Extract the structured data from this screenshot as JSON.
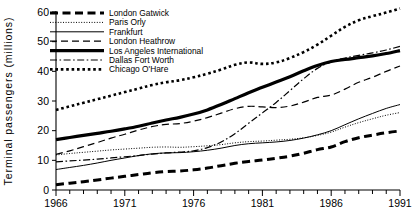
{
  "chart_data": {
    "type": "line",
    "title": "",
    "xlabel": "",
    "ylabel": "Terminal passengers (millions)",
    "xlim": [
      1966,
      1991
    ],
    "ylim": [
      0,
      60
    ],
    "grid": false,
    "legend_position": "top-left",
    "x_ticks_major": [
      "1966",
      "1971",
      "1976",
      "1981",
      "1986",
      "1991"
    ],
    "x_ticks_major_values": [
      1966,
      1971,
      1976,
      1981,
      1986,
      1991
    ],
    "x_minor_tick_step": 1,
    "y_ticks": [
      "0",
      "10",
      "20",
      "30",
      "40",
      "50",
      "60"
    ],
    "y_tick_values": [
      0,
      10,
      20,
      30,
      40,
      50,
      60
    ],
    "x": [
      1966,
      1967,
      1968,
      1969,
      1970,
      1971,
      1972,
      1973,
      1974,
      1975,
      1976,
      1977,
      1978,
      1979,
      1980,
      1981,
      1982,
      1983,
      1984,
      1985,
      1986,
      1987,
      1988,
      1989,
      1990,
      1991
    ],
    "series": [
      {
        "name": "London Gatwick",
        "style": "bold-dashed",
        "values": [
          1.8,
          2.3,
          2.8,
          3.4,
          4.0,
          4.6,
          5.2,
          5.8,
          6.2,
          6.4,
          6.8,
          7.4,
          8.2,
          9.0,
          9.6,
          10.1,
          10.7,
          11.4,
          12.4,
          13.6,
          14.5,
          16.3,
          17.6,
          18.5,
          19.3,
          19.9
        ]
      },
      {
        "name": "Paris Orly",
        "style": "fine-dotted",
        "values": [
          11.8,
          12.3,
          12.7,
          13.1,
          13.5,
          13.8,
          14.1,
          14.4,
          14.5,
          14.4,
          14.6,
          14.9,
          15.3,
          15.9,
          16.3,
          16.5,
          16.8,
          17.1,
          17.6,
          18.4,
          19.5,
          21.2,
          22.7,
          24.0,
          25.2,
          26.1
        ]
      },
      {
        "name": "Frankfurt",
        "style": "thin-solid",
        "values": [
          6.9,
          7.6,
          8.3,
          9.1,
          10.0,
          10.8,
          11.6,
          12.2,
          12.5,
          12.6,
          12.9,
          13.4,
          14.1,
          15.0,
          15.6,
          15.9,
          16.2,
          16.7,
          17.5,
          18.6,
          20.0,
          22.0,
          24.0,
          25.8,
          27.5,
          28.8
        ]
      },
      {
        "name": "London Heathrow",
        "style": "medium-dashed",
        "values": [
          12.0,
          13.2,
          14.6,
          16.0,
          17.5,
          18.8,
          20.2,
          21.4,
          22.1,
          22.4,
          23.2,
          24.4,
          25.9,
          27.4,
          28.2,
          28.0,
          27.8,
          28.3,
          29.6,
          31.2,
          32.0,
          34.0,
          36.3,
          38.0,
          40.0,
          41.8
        ]
      },
      {
        "name": "Los Angeles International",
        "style": "thick-solid",
        "values": [
          17.0,
          17.7,
          18.4,
          19.1,
          19.8,
          20.6,
          21.5,
          22.6,
          23.6,
          24.5,
          25.6,
          27.0,
          28.8,
          30.8,
          32.8,
          34.6,
          36.4,
          38.2,
          40.2,
          42.0,
          43.3,
          44.0,
          44.6,
          45.2,
          46.0,
          47.0
        ]
      },
      {
        "name": "Dallas Fort Worth",
        "style": "dash-dot",
        "values": [
          9.5,
          9.8,
          10.1,
          10.4,
          10.8,
          11.2,
          11.6,
          12.1,
          12.5,
          12.8,
          13.2,
          14.3,
          16.2,
          19.0,
          22.5,
          26.0,
          29.5,
          33.5,
          37.5,
          41.0,
          43.2,
          44.5,
          45.4,
          46.2,
          47.2,
          48.4
        ]
      },
      {
        "name": "Chicago O'Hare",
        "style": "thick-dotted",
        "values": [
          27.0,
          28.2,
          29.4,
          30.6,
          31.8,
          33.0,
          34.2,
          35.4,
          36.3,
          37.0,
          38.0,
          39.2,
          40.6,
          42.2,
          43.0,
          42.5,
          43.0,
          44.5,
          46.5,
          49.0,
          52.0,
          55.0,
          57.2,
          58.6,
          59.8,
          61.2
        ]
      }
    ]
  },
  "legend": {
    "items": [
      {
        "label": "London Gatwick"
      },
      {
        "label": "Paris Orly"
      },
      {
        "label": "Frankfurt"
      },
      {
        "label": "London Heathrow"
      },
      {
        "label": "Los Angeles International"
      },
      {
        "label": "Dallas Fort Worth"
      },
      {
        "label": "Chicago O'Hare"
      }
    ]
  }
}
